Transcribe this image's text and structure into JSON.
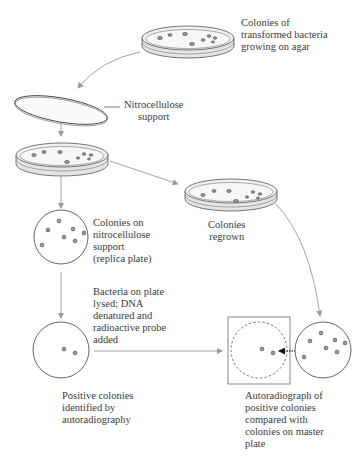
{
  "labels": {
    "master_plate": [
      "Colonies of",
      "transformed bacteria",
      "growing on agar"
    ],
    "nitrocellulose": [
      "Nitrocellulose",
      "support"
    ],
    "replica_plate": [
      "Colonies on",
      "nitrocellulose",
      "support",
      "(replica plate)"
    ],
    "regrown": [
      "Colonies",
      "regrown"
    ],
    "lysed": [
      "Bacteria on plate",
      "lysed; DNA",
      "denatured and",
      "radioactive probe",
      "added"
    ],
    "positive": [
      "Positive colonies",
      "identified by",
      "autoradiography"
    ],
    "autoradiograph": [
      "Autoradiograph of",
      "positive colonies",
      "compared with",
      "colonies on master",
      "plate"
    ]
  },
  "colors": {
    "arrow": "#9a9a9a",
    "outline": "#555555",
    "dish_fill": "#eeeeee",
    "colony": "#999999",
    "text": "#3a3a3a"
  }
}
